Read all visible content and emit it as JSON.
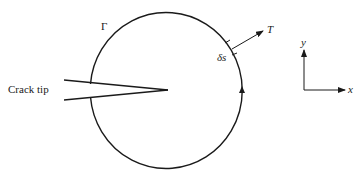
{
  "figure": {
    "type": "J-integral contour diagram",
    "labels": {
      "crack_tip": "Crack tip",
      "contour": "Γ",
      "arc_element": "δs",
      "traction": "T",
      "x_axis": "x",
      "y_axis": "y"
    },
    "colors": {
      "stroke": "#1a1a1a",
      "background": "#ffffff"
    }
  }
}
